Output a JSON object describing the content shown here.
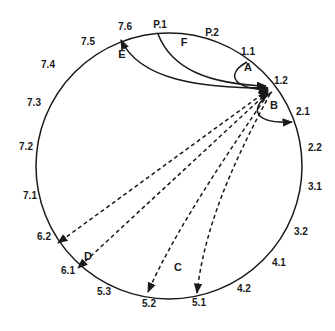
{
  "diagram": {
    "type": "circular-connection-diagram",
    "hub_node": "1.2",
    "nodes": [
      {
        "id": "P.1",
        "x": 160,
        "y": 28
      },
      {
        "id": "P.2",
        "x": 212,
        "y": 36
      },
      {
        "id": "1.1",
        "x": 248,
        "y": 55
      },
      {
        "id": "1.2",
        "x": 274,
        "y": 84
      },
      {
        "id": "2.1",
        "x": 296,
        "y": 115
      },
      {
        "id": "2.2",
        "x": 308,
        "y": 151
      },
      {
        "id": "3.1",
        "x": 308,
        "y": 190
      },
      {
        "id": "3.2",
        "x": 294,
        "y": 235
      },
      {
        "id": "4.1",
        "x": 272,
        "y": 266
      },
      {
        "id": "4.2",
        "x": 237,
        "y": 292
      },
      {
        "id": "5.1",
        "x": 191,
        "y": 306
      },
      {
        "id": "5.2",
        "x": 141,
        "y": 307
      },
      {
        "id": "5.3",
        "x": 96,
        "y": 295
      },
      {
        "id": "6.1",
        "x": 68,
        "y": 274
      },
      {
        "id": "6.2",
        "x": 50,
        "y": 240
      },
      {
        "id": "7.1",
        "x": 30,
        "y": 199
      },
      {
        "id": "7.2",
        "x": 26,
        "y": 150
      },
      {
        "id": "7.3",
        "x": 34,
        "y": 106
      },
      {
        "id": "7.4",
        "x": 48,
        "y": 68
      },
      {
        "id": "7.5",
        "x": 82,
        "y": 44
      },
      {
        "id": "7.6",
        "x": 119,
        "y": 30
      }
    ],
    "regions": [
      {
        "id": "A",
        "x": 238,
        "y": 65
      },
      {
        "id": "B",
        "x": 258,
        "y": 104
      },
      {
        "id": "C",
        "x": 178,
        "y": 271
      },
      {
        "id": "D",
        "x": 124,
        "y": 239
      },
      {
        "id": "E",
        "x": 120,
        "y": 55
      },
      {
        "id": "F",
        "x": 175,
        "y": 46
      }
    ],
    "edges": [
      {
        "from": "1.1",
        "to": "1.2",
        "style": "solid",
        "region": "A"
      },
      {
        "from": "1.2",
        "to": "2.1",
        "style": "solid",
        "region": "B"
      },
      {
        "from": "P.1",
        "to": "1.2",
        "style": "solid",
        "region": "F"
      },
      {
        "from": "7.6",
        "to": "1.2",
        "style": "solid",
        "bidirectional": true,
        "region": "E"
      },
      {
        "from": "1.2",
        "to": "6.2",
        "style": "dashed",
        "bidirectional": true,
        "region": "D"
      },
      {
        "from": "1.2",
        "to": "6.1",
        "style": "dashed",
        "bidirectional": true,
        "region": "D"
      },
      {
        "from": "1.2",
        "to": "5.2",
        "style": "dashed",
        "region": "C"
      },
      {
        "from": "1.2",
        "to": "5.1",
        "style": "dashed",
        "region": "C"
      }
    ],
    "colors": {
      "stroke": "#1a1a1a",
      "background": "#ffffff"
    }
  }
}
